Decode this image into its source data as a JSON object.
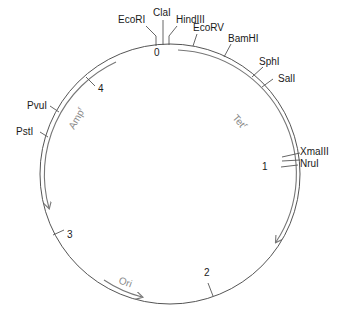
{
  "diagram": {
    "type": "plasmid-map",
    "origin_marker": "0",
    "kb_markers": [
      {
        "label": "0"
      },
      {
        "label": "1"
      },
      {
        "label": "2"
      },
      {
        "label": "3"
      },
      {
        "label": "4"
      }
    ],
    "restriction_sites": [
      {
        "name": "EcoRI"
      },
      {
        "name": "ClaI"
      },
      {
        "name": "HindIII"
      },
      {
        "name": "EcoRV"
      },
      {
        "name": "BamHI"
      },
      {
        "name": "SphI"
      },
      {
        "name": "SalI"
      },
      {
        "name": "XmaIII"
      },
      {
        "name": "NruI"
      },
      {
        "name": "PvuI"
      },
      {
        "name": "PstI"
      }
    ],
    "genes": [
      {
        "name": "Tet",
        "sup": "r",
        "direction": "clockwise"
      },
      {
        "name": "Amp",
        "sup": "r",
        "direction": "counterclockwise"
      },
      {
        "name": "Ori",
        "sup": "",
        "direction": "clockwise"
      }
    ],
    "colors": {
      "ring": "#555555",
      "gene_arrow": "#777777",
      "text": "#1a1a1a",
      "gene_text": "#888888"
    }
  }
}
